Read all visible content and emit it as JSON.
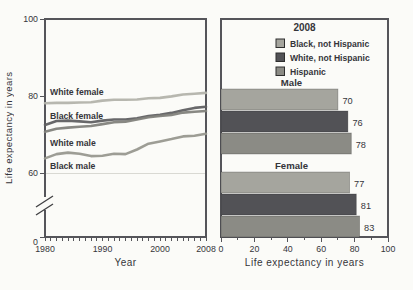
{
  "colors": {
    "background": "#fbfbf8",
    "axis": "#55555a",
    "text": "#35353a",
    "gridline": "#d9d9d3",
    "bar_black_not_hispanic": "#a5a59e",
    "bar_white_not_hispanic": "#525256",
    "bar_hispanic": "#8b8b85"
  },
  "chart_data": [
    {
      "type": "line",
      "title": "",
      "xlabel": "Year",
      "ylabel": "Life expectancy in years",
      "xlim": [
        1980,
        2008
      ],
      "ylim_shown": [
        0,
        100
      ],
      "axis_break_between": [
        0,
        60
      ],
      "x_ticks": [
        1980,
        1990,
        2000,
        2008
      ],
      "y_ticks": [
        0,
        60,
        80,
        100
      ],
      "gridline_at": 60,
      "grid": "single horizontal line at 60",
      "legend_position": "inline labels on lines",
      "x": [
        1980,
        1982,
        1984,
        1986,
        1988,
        1990,
        1992,
        1994,
        1996,
        1998,
        2000,
        2002,
        2004,
        2006,
        2008
      ],
      "series": [
        {
          "name": "White female",
          "color": "#b3b3ab",
          "label_side": "above",
          "values": [
            78.1,
            78.2,
            78.2,
            78.3,
            78.4,
            78.8,
            79.0,
            79.0,
            79.1,
            79.4,
            79.5,
            79.9,
            80.4,
            80.6,
            80.8
          ]
        },
        {
          "name": "Black female",
          "color": "#606062",
          "label_side": "above",
          "values": [
            72.5,
            73.5,
            73.6,
            73.4,
            73.2,
            73.6,
            73.9,
            73.9,
            74.2,
            74.8,
            75.1,
            75.6,
            76.3,
            76.9,
            77.2
          ]
        },
        {
          "name": "White male",
          "color": "#82827c",
          "label_side": "below",
          "values": [
            70.7,
            71.5,
            71.8,
            72.0,
            72.2,
            72.7,
            73.2,
            73.3,
            73.9,
            74.5,
            74.8,
            75.1,
            75.7,
            75.9,
            76.1
          ]
        },
        {
          "name": "Black male",
          "color": "#98988f",
          "label_side": "below",
          "values": [
            63.8,
            64.9,
            65.3,
            65.0,
            64.4,
            64.5,
            65.0,
            64.9,
            66.1,
            67.6,
            68.2,
            68.8,
            69.5,
            69.7,
            70.2
          ]
        }
      ]
    },
    {
      "type": "bar",
      "orientation": "horizontal",
      "title": "2008",
      "xlabel": "Life expectancy in years",
      "xlim": [
        0,
        100
      ],
      "x_ticks": [
        0,
        20,
        40,
        60,
        80,
        100
      ],
      "x_minor_tick_step": 10,
      "legend_position": "top inside frame",
      "legend": [
        {
          "label": "Black, not Hispanic",
          "color": "#a5a59e"
        },
        {
          "label": "White, not Hispanic",
          "color": "#525256"
        },
        {
          "label": "Hispanic",
          "color": "#8b8b85"
        }
      ],
      "groups": [
        {
          "label": "Male",
          "values": [
            70,
            76,
            78
          ]
        },
        {
          "label": "Female",
          "values": [
            77,
            81,
            83
          ]
        }
      ]
    }
  ]
}
